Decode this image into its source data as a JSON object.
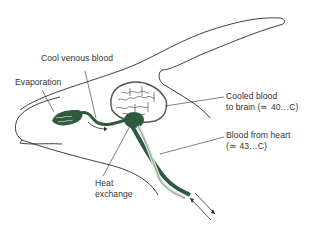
{
  "diagram": {
    "colors": {
      "vessel": "#2f5a3e",
      "vessel_light": "#d8e2da",
      "outline": "#2a2a2a",
      "text": "#333333",
      "background": "#ffffff"
    },
    "labels": {
      "cool_venous_blood": "Cool venous blood",
      "evaporation": "Evaporation",
      "cooled_blood_line1": "Cooled blood",
      "cooled_blood_line2": "to brain (≃ 40…C)",
      "blood_from_heart_line1": "Blood from heart",
      "blood_from_heart_line2": "(≃ 43…C)",
      "heat_exchange_line1": "Heat",
      "heat_exchange_line2": "exchange"
    },
    "components": [
      "head-outline",
      "horn",
      "nasal-vessel-network",
      "brain",
      "carotid-rete",
      "neck-vessels",
      "flow-arrows"
    ]
  }
}
